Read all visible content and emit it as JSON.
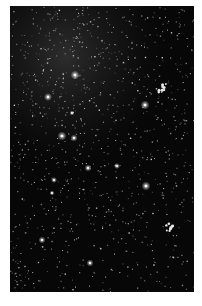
{
  "image": {
    "subject": "starfield",
    "description": "Dense field of stars against a black sky with faint nebulous haze in the upper-left region",
    "colors": {
      "page_background": "#ffffff",
      "sky": "#070707",
      "haze": "#3a3a3a",
      "star": "#ffffff"
    },
    "bright_stars": [
      {
        "name": "star-a"
      },
      {
        "name": "star-b"
      },
      {
        "name": "star-c"
      },
      {
        "name": "star-d"
      },
      {
        "name": "star-e"
      },
      {
        "name": "star-f"
      },
      {
        "name": "star-g"
      },
      {
        "name": "star-h"
      },
      {
        "name": "star-i"
      },
      {
        "name": "star-j"
      },
      {
        "name": "star-k"
      },
      {
        "name": "star-l"
      },
      {
        "name": "star-m"
      }
    ],
    "clusters": [
      {
        "name": "cluster-upper-right"
      },
      {
        "name": "cluster-lower-right"
      }
    ]
  }
}
